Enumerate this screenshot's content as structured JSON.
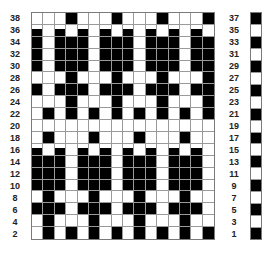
{
  "chart": {
    "type": "knitting-chart",
    "columns": 16,
    "left_labels": [
      "38",
      "36",
      "34",
      "32",
      "30",
      "28",
      "26",
      "24",
      "22",
      "20",
      "18",
      "16",
      "14",
      "12",
      "10",
      "8",
      "6",
      "4",
      "2"
    ],
    "right_labels": [
      "37",
      "35",
      "33",
      "31",
      "29",
      "27",
      "25",
      "23",
      "21",
      "19",
      "17",
      "15",
      "13",
      "11",
      "9",
      "7",
      "5",
      "3",
      "1"
    ],
    "rows": [
      {
        "label": "38",
        "notch": false,
        "cells": [
          0,
          0,
          0,
          1,
          0,
          0,
          0,
          1,
          0,
          0,
          0,
          1,
          0,
          0,
          0,
          1
        ]
      },
      {
        "label": "36",
        "notch": true,
        "cells": [
          1,
          0,
          1,
          0,
          1,
          0,
          1,
          0,
          1,
          0,
          1,
          0,
          1,
          0,
          1,
          0
        ]
      },
      {
        "label": "34",
        "notch": false,
        "cells": [
          1,
          0,
          1,
          1,
          1,
          0,
          1,
          1,
          1,
          0,
          1,
          1,
          1,
          0,
          1,
          1
        ]
      },
      {
        "label": "32",
        "notch": false,
        "cells": [
          1,
          0,
          1,
          1,
          1,
          0,
          1,
          1,
          1,
          0,
          1,
          1,
          1,
          0,
          1,
          1
        ]
      },
      {
        "label": "30",
        "notch": false,
        "cells": [
          1,
          0,
          1,
          1,
          1,
          0,
          1,
          1,
          1,
          0,
          1,
          1,
          1,
          0,
          1,
          1
        ]
      },
      {
        "label": "28",
        "notch": false,
        "cells": [
          0,
          0,
          0,
          1,
          0,
          0,
          0,
          1,
          0,
          0,
          0,
          1,
          0,
          0,
          0,
          1
        ]
      },
      {
        "label": "26",
        "notch": false,
        "cells": [
          1,
          0,
          1,
          1,
          1,
          0,
          1,
          1,
          1,
          0,
          1,
          1,
          1,
          0,
          1,
          1
        ]
      },
      {
        "label": "24",
        "notch": false,
        "cells": [
          0,
          0,
          0,
          1,
          0,
          0,
          0,
          1,
          0,
          0,
          0,
          1,
          0,
          0,
          0,
          1
        ]
      },
      {
        "label": "22",
        "notch": false,
        "cells": [
          0,
          1,
          0,
          1,
          0,
          1,
          0,
          1,
          0,
          1,
          0,
          1,
          0,
          1,
          0,
          1
        ]
      },
      {
        "label": "20",
        "notch": false,
        "cells": [
          0,
          0,
          0,
          0,
          0,
          0,
          0,
          0,
          0,
          0,
          0,
          0,
          0,
          0,
          0,
          0
        ]
      },
      {
        "label": "18",
        "notch": false,
        "cells": [
          0,
          1,
          0,
          0,
          0,
          1,
          0,
          0,
          0,
          1,
          0,
          0,
          0,
          1,
          0,
          0
        ]
      },
      {
        "label": "16",
        "notch": true,
        "cells": [
          1,
          0,
          1,
          0,
          1,
          0,
          1,
          0,
          1,
          0,
          1,
          0,
          1,
          0,
          1,
          0
        ]
      },
      {
        "label": "14",
        "notch": false,
        "cells": [
          1,
          1,
          1,
          0,
          1,
          1,
          1,
          0,
          1,
          1,
          1,
          0,
          1,
          1,
          1,
          0
        ]
      },
      {
        "label": "12",
        "notch": false,
        "cells": [
          1,
          1,
          1,
          0,
          1,
          1,
          1,
          0,
          1,
          1,
          1,
          0,
          1,
          1,
          1,
          0
        ]
      },
      {
        "label": "10",
        "notch": false,
        "cells": [
          1,
          1,
          1,
          0,
          1,
          1,
          1,
          0,
          1,
          1,
          1,
          0,
          1,
          1,
          1,
          0
        ]
      },
      {
        "label": "8",
        "notch": false,
        "cells": [
          0,
          1,
          0,
          0,
          0,
          1,
          0,
          0,
          0,
          1,
          0,
          0,
          0,
          1,
          0,
          0
        ]
      },
      {
        "label": "6",
        "notch": false,
        "cells": [
          1,
          1,
          1,
          0,
          1,
          1,
          1,
          0,
          1,
          1,
          1,
          0,
          1,
          1,
          1,
          0
        ]
      },
      {
        "label": "4",
        "notch": false,
        "cells": [
          0,
          1,
          0,
          0,
          0,
          1,
          0,
          0,
          0,
          1,
          0,
          0,
          0,
          1,
          0,
          0
        ]
      },
      {
        "label": "2",
        "notch": false,
        "cells": [
          0,
          1,
          0,
          1,
          0,
          1,
          0,
          1,
          0,
          1,
          0,
          1,
          0,
          1,
          0,
          1
        ]
      }
    ],
    "color_strip": [
      1,
      0,
      1,
      0,
      1,
      0,
      1,
      0,
      1,
      0,
      1,
      0,
      1,
      0,
      1,
      0,
      1,
      0,
      1
    ],
    "colors": {
      "filled": "#000000",
      "empty": "#ffffff",
      "grid_line": "#9a9a9a"
    }
  }
}
